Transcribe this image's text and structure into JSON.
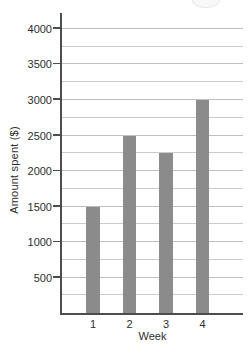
{
  "chart_data": {
    "type": "bar",
    "title": "",
    "categories": [
      "1",
      "2",
      "3",
      "4"
    ],
    "values": [
      1500,
      2500,
      2250,
      3000
    ],
    "xlabel": "Week",
    "ylabel": "Amount spent ($)",
    "yticks": [
      500,
      1000,
      1500,
      2000,
      2500,
      3000,
      3500,
      4000
    ],
    "gridline_interval": 250,
    "ylim": [
      0,
      4225
    ],
    "grid": true,
    "legend": "none",
    "colors": {
      "bar": "#8b8b8b",
      "gridline_minor": "#cbcbcb",
      "gridline_major": "#bdbdbd",
      "axis": "#4d4d4d",
      "text": "#2e2e2e",
      "background": "#ffffff"
    }
  }
}
